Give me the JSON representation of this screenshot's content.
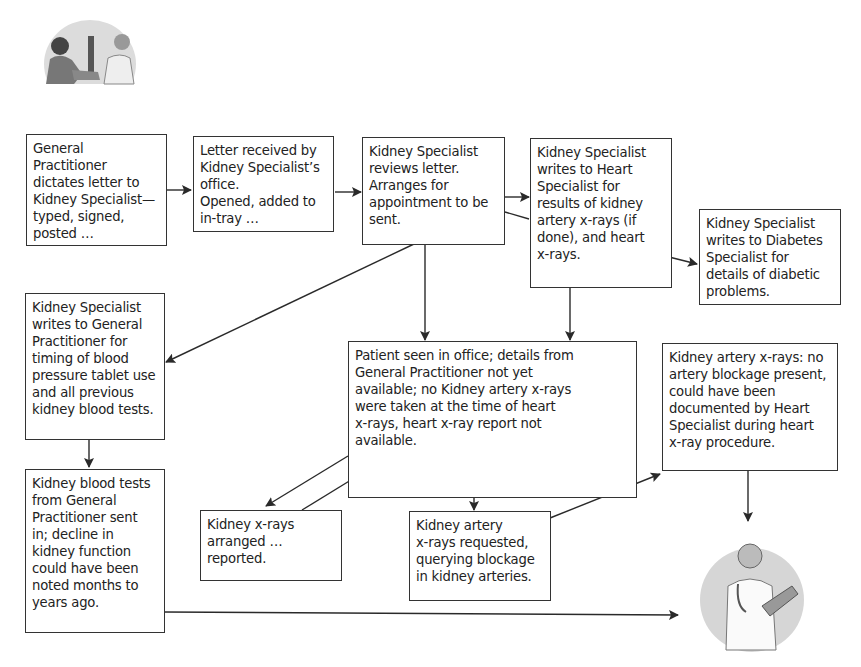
{
  "diagram": {
    "boxes": [
      {
        "id": "gp-dictates",
        "text": "General\nPractitioner\ndictates letter to\nKidney Specialist—\ntyped, signed,\nposted …"
      },
      {
        "id": "letter-received",
        "text": "Letter received by\nKidney Specialist’s\noffice.\nOpened, added to\nin-tray …"
      },
      {
        "id": "ks-reviews",
        "text": "Kidney Specialist\nreviews letter.\nArranges for\nappointment to be\nsent."
      },
      {
        "id": "ks-writes-heart",
        "text": "Kidney Specialist\nwrites to Heart\nSpecialist for\nresults of kidney\nartery x-rays (if\ndone), and heart\nx-rays."
      },
      {
        "id": "ks-writes-diabetes",
        "text": "Kidney Specialist\nwrites to Diabetes\nSpecialist for\ndetails of diabetic\nproblems."
      },
      {
        "id": "ks-writes-gp",
        "text": "Kidney Specialist\nwrites to General\nPractitioner for\ntiming of blood\npressure tablet use\nand all previous\nkidney blood tests."
      },
      {
        "id": "patient-seen",
        "text": "Patient seen in office; details from\nGeneral Practitioner not yet\navailable; no Kidney artery x-rays\nwere taken at the time of heart\nx-rays, heart x-ray report not\navailable."
      },
      {
        "id": "artery-xrays-result",
        "text": "Kidney artery x-rays: no\nartery blockage present,\ncould have been\ndocumented by Heart\nSpecialist during heart\nx-ray procedure."
      },
      {
        "id": "blood-tests",
        "text": "Kidney blood tests\nfrom General\nPractitioner sent\nin; decline in\nkidney function\ncould have been\nnoted months to\nyears ago."
      },
      {
        "id": "kidney-xrays",
        "text": "Kidney x-rays\narranged …\nreported."
      },
      {
        "id": "artery-xrays-requested",
        "text": "Kidney artery\nx-rays requested,\nquerying blockage\nin kidney arteries."
      }
    ],
    "illustrations": [
      {
        "id": "gp-with-patient",
        "description": "doctor measuring patient blood pressure"
      },
      {
        "id": "specialist-with-clipboard",
        "description": "specialist doctor holding clipboard"
      }
    ],
    "colors": {
      "line": "#2a2a2a",
      "border": "#333333",
      "illustration_bg": "#d6d6d6"
    }
  }
}
